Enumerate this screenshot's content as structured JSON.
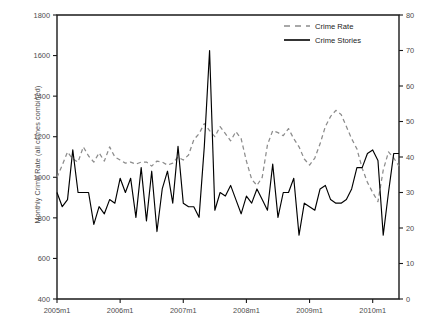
{
  "chart_data": {
    "type": "line",
    "title": "",
    "xlabel": "",
    "ylabel": "Monthly Crime Rate (all crimes combined)",
    "y2label": "Monthly Crime Stories (all crimes combined)",
    "xlim": [
      "2005m1",
      "2010m6"
    ],
    "ylim": [
      400,
      1800
    ],
    "y2lim": [
      0,
      80
    ],
    "grid": false,
    "legend_position": "top-right",
    "x_tick_labels": [
      "2005m1",
      "2006m1",
      "2007m1",
      "2008m1",
      "2009m1",
      "2010m1"
    ],
    "x_tick_values": [
      0,
      12,
      24,
      36,
      48,
      60
    ],
    "y_tick_labels": [
      "400",
      "600",
      "800",
      "1000",
      "1200",
      "1400",
      "1600",
      "1800"
    ],
    "y_tick_values": [
      400,
      600,
      800,
      1000,
      1200,
      1400,
      1600,
      1800
    ],
    "y2_tick_labels": [
      "0",
      "10",
      "20",
      "30",
      "40",
      "50",
      "60",
      "70",
      "80"
    ],
    "y2_tick_values": [
      0,
      10,
      20,
      30,
      40,
      50,
      60,
      70,
      80
    ],
    "x": [
      0,
      1,
      2,
      3,
      4,
      5,
      6,
      7,
      8,
      9,
      10,
      11,
      12,
      13,
      14,
      15,
      16,
      17,
      18,
      19,
      20,
      21,
      22,
      23,
      24,
      25,
      26,
      27,
      28,
      29,
      30,
      31,
      32,
      33,
      34,
      35,
      36,
      37,
      38,
      39,
      40,
      41,
      42,
      43,
      44,
      45,
      46,
      47,
      48,
      49,
      50,
      51,
      52,
      53,
      54,
      55,
      56,
      57,
      58,
      59,
      60,
      61,
      62,
      63,
      64,
      65
    ],
    "series": [
      {
        "name": "Crime Rate",
        "axis": "left",
        "style": "dashed",
        "color": "#8c8c8c",
        "values": [
          1000,
          1060,
          1125,
          1090,
          1075,
          1150,
          1105,
          1075,
          1120,
          1080,
          1150,
          1100,
          1085,
          1070,
          1075,
          1065,
          1075,
          1075,
          1055,
          1080,
          1075,
          1060,
          1070,
          1100,
          1085,
          1110,
          1185,
          1215,
          1265,
          1230,
          1200,
          1250,
          1215,
          1180,
          1225,
          1190,
          1080,
          990,
          960,
          1000,
          1160,
          1230,
          1220,
          1205,
          1240,
          1190,
          1150,
          1090,
          1060,
          1095,
          1165,
          1250,
          1300,
          1330,
          1310,
          1250,
          1190,
          1140,
          1045,
          975,
          925,
          880,
          1035,
          1125,
          1095,
          1055
        ]
      },
      {
        "name": "Crime Stories",
        "axis": "right",
        "style": "solid",
        "color": "#000000",
        "values": [
          30,
          26,
          28,
          42,
          30,
          30,
          30,
          21,
          26,
          24,
          28,
          27,
          34,
          30,
          34,
          23,
          37,
          22,
          36,
          19,
          31,
          36,
          27,
          43,
          27,
          26,
          26,
          23,
          43,
          70,
          25,
          30,
          29,
          32,
          28,
          24,
          29,
          27,
          31,
          28,
          25,
          38,
          23,
          30,
          30,
          34,
          18,
          27,
          26,
          25,
          31,
          32,
          28,
          27,
          27,
          28,
          31,
          37,
          37,
          41,
          42,
          39,
          18,
          30,
          41,
          41
        ]
      }
    ]
  },
  "legend": {
    "items": [
      {
        "label": "Crime Rate",
        "style": "dashed"
      },
      {
        "label": "Crime Stories",
        "style": "solid"
      }
    ]
  }
}
